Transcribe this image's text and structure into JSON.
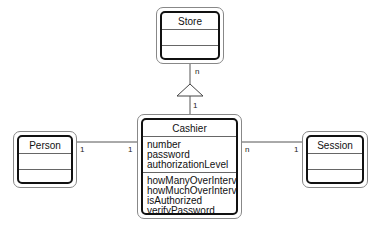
{
  "diagram": {
    "type": "UML class diagram",
    "classes": [
      {
        "name": "Store",
        "attributes": [],
        "operations": []
      },
      {
        "name": "Cashier",
        "attributes": [
          "number",
          "password",
          "authorizationLevel"
        ],
        "operations": [
          "howManyOverInterval",
          "howMuchOverInterval",
          "isAuthorized",
          "verifyPassword"
        ]
      },
      {
        "name": "Person",
        "attributes": [],
        "operations": []
      },
      {
        "name": "Session",
        "attributes": [],
        "operations": []
      }
    ],
    "relationships": [
      {
        "from": "Cashier",
        "to": "Store",
        "kind": "aggregation-triangle",
        "mult_store": "n",
        "mult_cashier": "1"
      },
      {
        "from": "Person",
        "to": "Cashier",
        "kind": "association",
        "mult_person": "1",
        "mult_cashier": "1"
      },
      {
        "from": "Cashier",
        "to": "Session",
        "kind": "association",
        "mult_cashier": "n",
        "mult_session": "1"
      }
    ]
  }
}
